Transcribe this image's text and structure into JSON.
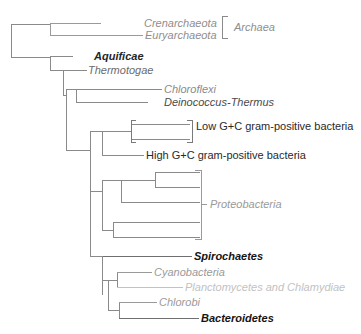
{
  "figure": {
    "kind": "phylogenetic-tree",
    "type": "cladogram",
    "background_color": "#ffffff",
    "width": 361,
    "height": 334,
    "line_color": "#7a7a7a",
    "line_color_dark": "#555555",
    "text_color_dark": "#1d1d1d",
    "text_color_mid": "#6b6b6b",
    "text_color_light": "#b4b4b4"
  },
  "taxa": [
    {
      "id": "crenarchaeota",
      "label": "Crenarchaeota",
      "style": "italic",
      "color": "#8e8e8e",
      "tip_y": 23,
      "branch_x_start": 50,
      "branch_x_end": 101,
      "label_x": 144
    },
    {
      "id": "euryarchaeota",
      "label": "Euryarchaeota",
      "style": "italic",
      "color": "#8e8e8e",
      "tip_y": 35,
      "branch_x_start": 50,
      "branch_x_end": 143,
      "label_x": 145
    },
    {
      "id": "aquificae",
      "label": "Aquificae",
      "style": "bold-italic",
      "color": "#262626",
      "tip_y": 56,
      "branch_x_start": 50,
      "branch_x_end": 73,
      "label_x": 94
    },
    {
      "id": "thermotogae",
      "label": "Thermotogae",
      "style": "italic",
      "color": "#6b6b6b",
      "tip_y": 70,
      "branch_x_start": 63,
      "branch_x_end": 87,
      "label_x": 88
    },
    {
      "id": "chloroflexi",
      "label": "Chloroflexi",
      "style": "italic",
      "color": "#8a8a8a",
      "tip_y": 89,
      "branch_x_start": 76,
      "branch_x_end": 162,
      "label_x": 164
    },
    {
      "id": "deinococcus-thermus",
      "label": "Deinococcus-Thermus",
      "style": "italic",
      "color": "#4a4a4a",
      "tip_y": 102,
      "branch_x_start": 76,
      "branch_x_end": 148,
      "label_x": 164
    },
    {
      "id": "low-gc-a",
      "label": "",
      "style": "none",
      "color": "#7a7a7a",
      "tip_y": 124,
      "branch_x_start": 131,
      "branch_x_end": 190,
      "label_x": 0
    },
    {
      "id": "low-gc-b",
      "label": "",
      "style": "none",
      "color": "#7a7a7a",
      "tip_y": 139,
      "branch_x_start": 131,
      "branch_x_end": 190,
      "label_x": 0
    },
    {
      "id": "high-gc",
      "label": "High G+C gram-positive bacteria",
      "style": "regular",
      "color": "#2a2a2a",
      "tip_y": 155,
      "branch_x_start": 102,
      "branch_x_end": 144,
      "label_x": 146
    },
    {
      "id": "proteo-1",
      "label": "",
      "style": "none",
      "color": "#7a7a7a",
      "tip_y": 172,
      "branch_x_start": 155,
      "branch_x_end": 200,
      "label_x": 0
    },
    {
      "id": "proteo-2",
      "label": "",
      "style": "none",
      "color": "#7a7a7a",
      "tip_y": 187,
      "branch_x_start": 155,
      "branch_x_end": 200,
      "label_x": 0
    },
    {
      "id": "proteo-3",
      "label": "",
      "style": "none",
      "color": "#7a7a7a",
      "tip_y": 202,
      "branch_x_start": 121,
      "branch_x_end": 200,
      "label_x": 0
    },
    {
      "id": "proteo-4",
      "label": "",
      "style": "none",
      "color": "#7a7a7a",
      "tip_y": 222,
      "branch_x_start": 113,
      "branch_x_end": 200,
      "label_x": 0
    },
    {
      "id": "proteo-5",
      "label": "",
      "style": "none",
      "color": "#7a7a7a",
      "tip_y": 237,
      "branch_x_start": 113,
      "branch_x_end": 200,
      "label_x": 0
    },
    {
      "id": "spirochaetes",
      "label": "Spirochaetes",
      "style": "bold-italic",
      "color": "#141414",
      "tip_y": 256,
      "branch_x_start": 102,
      "branch_x_end": 192,
      "label_x": 194
    },
    {
      "id": "cyanobacteria",
      "label": "Cyanobacteria",
      "style": "italic",
      "color": "#9a9a9a",
      "tip_y": 272,
      "branch_x_start": 117,
      "branch_x_end": 152,
      "label_x": 154
    },
    {
      "id": "planctomycetes-chlamydiae",
      "label": "Planctomycetes and Chlamydiae",
      "style": "italic",
      "color": "#c2c2c2",
      "tip_y": 287,
      "branch_x_start": 117,
      "branch_x_end": 183,
      "label_x": 185
    },
    {
      "id": "chlorobi",
      "label": "Chlorobi",
      "style": "italic",
      "color": "#9a9a9a",
      "tip_y": 302,
      "branch_x_start": 119,
      "branch_x_end": 157,
      "label_x": 159
    },
    {
      "id": "bacteroidetes",
      "label": "Bacteroidetes",
      "style": "bold-italic",
      "color": "#141414",
      "tip_y": 318,
      "branch_x_start": 119,
      "branch_x_end": 199,
      "label_x": 201
    }
  ],
  "group_brackets": [
    {
      "id": "archaea",
      "label": "Archaea",
      "style": "italic",
      "color": "#8e8e8e",
      "bracket_x": 222,
      "bracket_top": 16,
      "bracket_bottom": 38,
      "tick_len": 6,
      "label_x": 234,
      "label_y": 27
    },
    {
      "id": "low-gc",
      "label": "Low G+C gram-positive bacteria",
      "style": "regular",
      "color": "#2a2a2a",
      "bracket_x": 192,
      "bracket_top": 120,
      "bracket_bottom": 142,
      "tick_len": 5,
      "label_x": 196,
      "label_y": 126
    },
    {
      "id": "low-gc-left",
      "label": "",
      "style": "none",
      "color": "#7a7a7a",
      "bracket_x": 131,
      "bracket_top": 120,
      "bracket_bottom": 142,
      "tick_len": 5,
      "label_x": 0,
      "label_y": 0
    },
    {
      "id": "proteobacteria",
      "label": "Proteobacteria",
      "style": "italic",
      "color": "#9a9a9a",
      "bracket_x": 201,
      "bracket_top": 170,
      "bracket_bottom": 239,
      "tick_len": 6,
      "label_x": 210,
      "label_y": 204
    }
  ],
  "nodes": [
    {
      "id": "root",
      "x": 11,
      "y_top": 24,
      "y_bottom": 57
    },
    {
      "id": "archaea-node",
      "x": 50,
      "y_top": 23,
      "y_bottom": 35
    },
    {
      "id": "bact-node-1",
      "x": 50,
      "y_top": 56,
      "y_bottom": 70
    },
    {
      "id": "bact-node-2",
      "x": 63,
      "y_top": 70,
      "y_bottom": 93
    },
    {
      "id": "dc-node",
      "x": 76,
      "y_top": 89,
      "y_bottom": 102
    },
    {
      "id": "bact-node-3",
      "x": 66,
      "y_top": 95,
      "y_bottom": 155
    },
    {
      "id": "gram-node",
      "x": 102,
      "y_top": 131,
      "y_bottom": 155
    },
    {
      "id": "lowgc-node",
      "x": 131,
      "y_top": 124,
      "y_bottom": 139
    },
    {
      "id": "bact-node-4",
      "x": 90,
      "y_top": 150,
      "y_bottom": 256
    },
    {
      "id": "proteo-a",
      "x": 155,
      "y_top": 172,
      "y_bottom": 187
    },
    {
      "id": "proteo-b",
      "x": 121,
      "y_top": 180,
      "y_bottom": 202
    },
    {
      "id": "proteo-c",
      "x": 113,
      "y_top": 222,
      "y_bottom": 237
    },
    {
      "id": "proteo-d",
      "x": 102,
      "y_top": 191,
      "y_bottom": 230
    },
    {
      "id": "bact-node-5",
      "x": 102,
      "y_top": 212,
      "y_bottom": 256
    },
    {
      "id": "bact-node-6",
      "x": 102,
      "y_top": 256,
      "y_bottom": 295
    },
    {
      "id": "cyano-node",
      "x": 117,
      "y_top": 272,
      "y_bottom": 287
    },
    {
      "id": "chloro-node",
      "x": 119,
      "y_top": 302,
      "y_bottom": 318
    },
    {
      "id": "bot-node",
      "x": 108,
      "y_top": 280,
      "y_bottom": 310
    }
  ]
}
